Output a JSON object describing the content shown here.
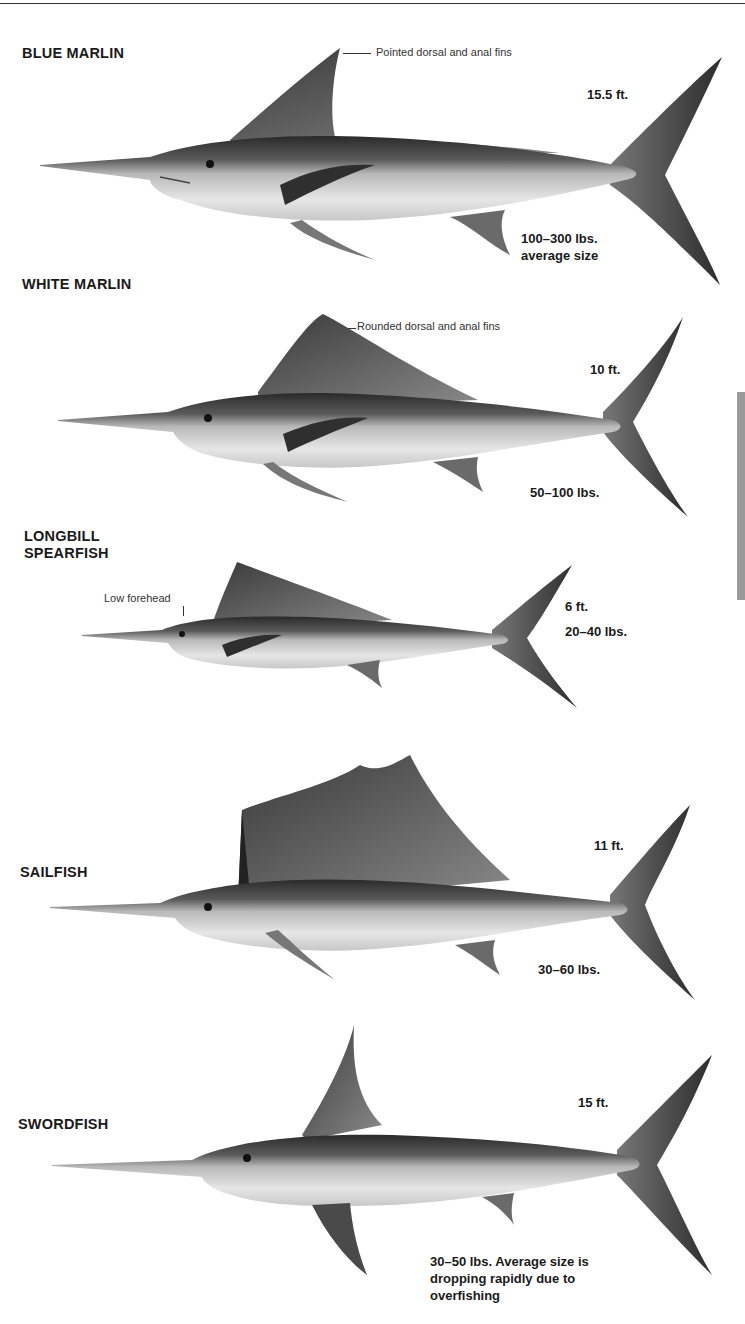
{
  "fish": [
    {
      "name": "BLUE MARLIN",
      "note": "Pointed dorsal and anal fins",
      "length": "15.5 ft.",
      "weight": "100–300 lbs.\naverage size"
    },
    {
      "name": "WHITE MARLIN",
      "note": "Rounded dorsal and anal fins",
      "length": "10 ft.",
      "weight": "50–100 lbs."
    },
    {
      "name": "LONGBILL\nSPEARFISH",
      "note": "Low forehead",
      "length": "6 ft.",
      "weight": "20–40 lbs."
    },
    {
      "name": "SAILFISH",
      "length": "11 ft.",
      "weight": "30–60 lbs."
    },
    {
      "name": "SWORDFISH",
      "length": "15 ft.",
      "weight": "30–50 lbs. Average size is\ndropping rapidly due to\noverfishing"
    }
  ],
  "colors": {
    "text": "#1a1a1a",
    "fish_dark": "#2b2b2b",
    "fish_mid": "#8c8c8c",
    "fish_light": "#e2e2e2",
    "side_tab": "#9a9a9a"
  }
}
